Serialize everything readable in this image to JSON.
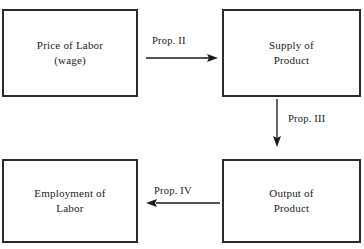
{
  "diagram": {
    "background_color": "#ffffff",
    "line_color": "#1a1a1a",
    "box_border_color": "#2b2b2b",
    "nodes": [
      {
        "id": "price-of-labor",
        "label": "Price of Labor\n(wage)"
      },
      {
        "id": "supply-of-product",
        "label": "Supply of\nProduct"
      },
      {
        "id": "employment-of-labor",
        "label": "Employment of\nLabor"
      },
      {
        "id": "output-of-product",
        "label": "Output of\nProduct"
      }
    ],
    "edges": [
      {
        "id": "edge-prop-2",
        "label": "Prop. II",
        "direction": "right",
        "from": "price-of-labor",
        "to": "supply-of-product"
      },
      {
        "id": "edge-prop-3",
        "label": "Prop. III",
        "direction": "down",
        "from": "supply-of-product",
        "to": "output-of-product"
      },
      {
        "id": "edge-prop-4",
        "label": "Prop. IV",
        "direction": "left",
        "from": "output-of-product",
        "to": "employment-of-labor"
      }
    ]
  }
}
